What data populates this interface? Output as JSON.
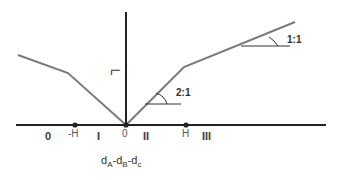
{
  "diagram": {
    "colors": {
      "axis": "#222222",
      "curve": "#7a7a7a",
      "text": "#333333"
    },
    "vertical_axis_label": "L",
    "x_axis_label": {
      "parts": [
        "d",
        "A",
        "-d",
        "B",
        "-d",
        "c"
      ],
      "text": "dA-dB-dc"
    },
    "regions": [
      {
        "id": "0",
        "label": "0"
      },
      {
        "id": "I",
        "label": "I"
      },
      {
        "id": "II",
        "label": "II"
      },
      {
        "id": "III",
        "label": "III"
      }
    ],
    "ticks": [
      {
        "label": "-H"
      },
      {
        "label": "0"
      },
      {
        "label": "H"
      }
    ],
    "slope_annotations": [
      {
        "label": "2:1"
      },
      {
        "label": "1:1"
      }
    ]
  }
}
